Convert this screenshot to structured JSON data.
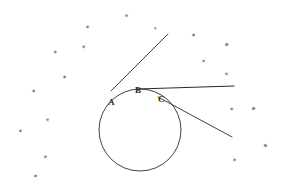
{
  "figure": {
    "background_color": "#ffffff",
    "ink_color": "#2b2b2b",
    "speckle_color": "#3a3a3a",
    "width": 284,
    "height": 188
  },
  "labels": [
    {
      "text": "A",
      "x": 108,
      "y": 98,
      "size": 9
    },
    {
      "text": "B",
      "x": 135,
      "y": 86,
      "size": 9
    },
    {
      "text": "C",
      "x": 158,
      "y": 95,
      "size": 9
    }
  ],
  "circle": {
    "cx": 140,
    "cy": 130,
    "r": 41,
    "stroke": "#2b2b2b",
    "stroke_width": 0.9
  },
  "lines": [
    {
      "name": "line-from-A",
      "x1": 111,
      "y1": 91,
      "x2": 168,
      "y2": 34,
      "stroke": "#2b2b2b",
      "stroke_width": 0.9
    },
    {
      "name": "tangent-at-B",
      "x1": 137,
      "y1": 89,
      "x2": 234,
      "y2": 86,
      "stroke": "#2b2b2b",
      "stroke_width": 1.1
    },
    {
      "name": "line-from-C",
      "x1": 158,
      "y1": 97,
      "x2": 232,
      "y2": 137,
      "stroke": "#2b2b2b",
      "stroke_width": 0.9
    }
  ],
  "speckles": [
    {
      "glyph": "✶",
      "x": 124,
      "y": 13,
      "size": 6,
      "rot": 14,
      "opacity": 0.72
    },
    {
      "glyph": "✶",
      "x": 85,
      "y": 24,
      "size": 6,
      "rot": -22,
      "opacity": 0.8
    },
    {
      "glyph": "✶",
      "x": 153,
      "y": 26,
      "size": 5,
      "rot": 40,
      "opacity": 0.7
    },
    {
      "glyph": "✶",
      "x": 191,
      "y": 32,
      "size": 6,
      "rot": 8,
      "opacity": 0.85
    },
    {
      "glyph": "✶",
      "x": 81,
      "y": 44,
      "size": 6,
      "rot": 33,
      "opacity": 0.78
    },
    {
      "glyph": "✶",
      "x": 224,
      "y": 42,
      "size": 7,
      "rot": -10,
      "opacity": 0.82
    },
    {
      "glyph": "✶",
      "x": 53,
      "y": 49,
      "size": 6,
      "rot": -40,
      "opacity": 0.75
    },
    {
      "glyph": "✶",
      "x": 201,
      "y": 58,
      "size": 6,
      "rot": 20,
      "opacity": 0.7
    },
    {
      "glyph": "✶",
      "x": 62,
      "y": 74,
      "size": 6,
      "rot": 5,
      "opacity": 0.86
    },
    {
      "glyph": "✶",
      "x": 224,
      "y": 71,
      "size": 6,
      "rot": -28,
      "opacity": 0.72
    },
    {
      "glyph": "✶",
      "x": 31,
      "y": 88,
      "size": 6,
      "rot": 45,
      "opacity": 0.8
    },
    {
      "glyph": "✶",
      "x": 229,
      "y": 106,
      "size": 6,
      "rot": 12,
      "opacity": 0.78
    },
    {
      "glyph": "✶",
      "x": 251,
      "y": 106,
      "size": 7,
      "rot": -18,
      "opacity": 0.82
    },
    {
      "glyph": "✶",
      "x": 45,
      "y": 117,
      "size": 6,
      "rot": 28,
      "opacity": 0.68
    },
    {
      "glyph": "✶",
      "x": 18,
      "y": 128,
      "size": 6,
      "rot": -6,
      "opacity": 0.8
    },
    {
      "glyph": "✶",
      "x": 262,
      "y": 143,
      "size": 7,
      "rot": 22,
      "opacity": 0.8
    },
    {
      "glyph": "✶",
      "x": 43,
      "y": 154,
      "size": 6,
      "rot": -34,
      "opacity": 0.78
    },
    {
      "glyph": "✶",
      "x": 232,
      "y": 157,
      "size": 6,
      "rot": 16,
      "opacity": 0.8
    },
    {
      "glyph": "✶",
      "x": 33,
      "y": 173,
      "size": 6,
      "rot": 7,
      "opacity": 0.76
    }
  ]
}
